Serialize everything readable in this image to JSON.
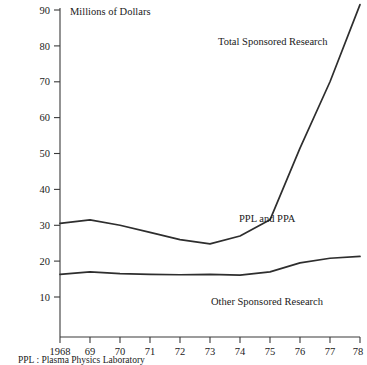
{
  "chart_data": {
    "type": "line",
    "title": "",
    "ylabel": "Millions of Dollars",
    "xlabel": "",
    "x": [
      1968,
      1969,
      1970,
      1971,
      1972,
      1973,
      1974,
      1975,
      1976,
      1977,
      1978
    ],
    "xtick_labels": [
      "1968",
      "69",
      "70",
      "71",
      "72",
      "73",
      "74",
      "75",
      "76",
      "77",
      "78"
    ],
    "ytick_labels": [
      "10",
      "20",
      "30",
      "40",
      "50",
      "60",
      "70",
      "80",
      "90"
    ],
    "yticks": [
      10,
      20,
      30,
      40,
      50,
      60,
      70,
      80,
      90
    ],
    "ylim": [
      0,
      93
    ],
    "xlim": [
      1968,
      1978
    ],
    "grid": false,
    "legend_position": "inline-annotations",
    "series": [
      {
        "name": "Total Sponsored Research",
        "label": "Total Sponsored Research",
        "values": [
          30.5,
          31.5,
          30.0,
          28.0,
          26.0,
          24.8,
          27.0,
          31.5,
          51.5,
          70.0,
          91.5
        ]
      },
      {
        "name": "Other Sponsored Research",
        "label": "Other Sponsored Research",
        "values": [
          16.3,
          17.0,
          16.5,
          16.3,
          16.2,
          16.3,
          16.1,
          17.0,
          19.5,
          20.8,
          21.3
        ]
      }
    ],
    "annotations": [
      {
        "text": "Total Sponsored Research",
        "x": 1974.0,
        "y": 83.0
      },
      {
        "text": "PPL and PPA",
        "x": 1973.6,
        "y": 27.5
      },
      {
        "text": "Other Sponsored Research",
        "x": 1973.2,
        "y": 5.5
      }
    ],
    "footnote": "PPL : Plasma Physics Laboratory",
    "colors": {
      "line": "#2e2e2e",
      "axis": "#3a3a3a",
      "text": "#1a1a1a",
      "background": "#ffffff"
    }
  }
}
